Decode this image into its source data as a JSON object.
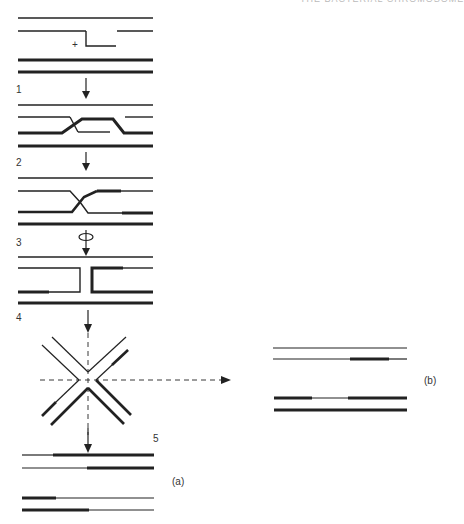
{
  "header": {
    "running_title": "THE BACTERIAL CHROMOSOME"
  },
  "steps": [
    {
      "number": "1"
    },
    {
      "number": "2"
    },
    {
      "number": "3"
    },
    {
      "number": "4"
    },
    {
      "number": "5"
    }
  ],
  "panels": {
    "a": {
      "label": "(a)"
    },
    "b": {
      "label": "(b)"
    }
  },
  "annotations": {
    "nick_marker": "+"
  },
  "colors": {
    "strand": "#222222",
    "background": "#ffffff"
  },
  "icons": [
    "down-arrow-icon",
    "rotation-icon",
    "dashed-arrow-icon"
  ]
}
